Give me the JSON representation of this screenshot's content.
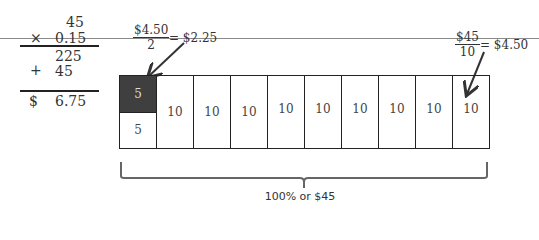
{
  "multiplication": {
    "multiplicand": "45",
    "times_sign": "×",
    "multiplier": "0.15",
    "partial_1": "225",
    "plus_sign": "+",
    "partial_2": "45",
    "currency": "$",
    "result": "6.75"
  },
  "annotation_left": {
    "numerator": "$4.50",
    "denominator": "2",
    "result": "= $2.25"
  },
  "annotation_right": {
    "numerator": "$45",
    "denominator": "10",
    "result": "= $4.50"
  },
  "tape": {
    "first_cell": {
      "top": "5",
      "bottom": "5",
      "top_color": "#3f3f3f"
    },
    "cells": [
      "10",
      "10",
      "10",
      "10",
      "10",
      "10",
      "10",
      "10",
      "10"
    ]
  },
  "brace_label": "100% or $45"
}
